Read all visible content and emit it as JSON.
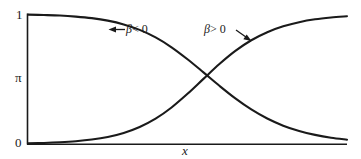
{
  "chart_data": {
    "type": "line",
    "title": "",
    "xlabel": "x",
    "ylabel": "π",
    "ylim": [
      0,
      1
    ],
    "xlim": [
      0,
      1
    ],
    "grid": false,
    "legend_position": "inline-annotations",
    "ytick_labels": [
      "0",
      "1"
    ],
    "ytick_values": [
      0,
      1
    ],
    "xtick_labels": [],
    "series": [
      {
        "name": "β < 0",
        "description": "decreasing logistic curve",
        "annotation": "β < 0",
        "color": "#1a1a1a",
        "x": [
          0.0,
          0.05,
          0.1,
          0.15,
          0.2,
          0.25,
          0.3,
          0.35,
          0.4,
          0.45,
          0.5,
          0.55,
          0.6,
          0.65,
          0.7,
          0.75,
          0.8,
          0.85,
          0.9,
          0.95,
          1.0
        ],
        "values": [
          0.995,
          0.992,
          0.988,
          0.98,
          0.968,
          0.949,
          0.92,
          0.878,
          0.82,
          0.744,
          0.652,
          0.551,
          0.448,
          0.351,
          0.266,
          0.196,
          0.141,
          0.1,
          0.07,
          0.048,
          0.033
        ]
      },
      {
        "name": "β > 0",
        "description": "increasing logistic curve",
        "annotation": "β > 0",
        "color": "#1a1a1a",
        "x": [
          0.0,
          0.05,
          0.1,
          0.15,
          0.2,
          0.25,
          0.3,
          0.35,
          0.4,
          0.45,
          0.5,
          0.55,
          0.6,
          0.65,
          0.7,
          0.75,
          0.8,
          0.85,
          0.9,
          0.95,
          1.0
        ],
        "values": [
          0.005,
          0.008,
          0.013,
          0.021,
          0.034,
          0.054,
          0.085,
          0.131,
          0.195,
          0.281,
          0.386,
          0.501,
          0.615,
          0.716,
          0.798,
          0.86,
          0.905,
          0.937,
          0.959,
          0.973,
          0.983
        ]
      }
    ],
    "crossing_point": {
      "x": 0.5,
      "y": 0.315
    },
    "axis_color": "#1a1a1a",
    "background": "#ffffff"
  },
  "labels": {
    "y_top": "1",
    "y_axis": "π",
    "y_bottom": "0",
    "x_axis": "x"
  },
  "annotations": {
    "negative": {
      "beta": "β",
      "relation": "< 0",
      "full": "β < 0"
    },
    "positive": {
      "beta": "β",
      "relation": "> 0",
      "full": "β > 0"
    }
  }
}
